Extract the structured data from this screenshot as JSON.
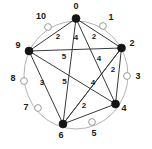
{
  "chart_data": {
    "type": "diagram",
    "title": "",
    "subtitle": "",
    "xlabel": "",
    "ylabel": "",
    "layout": "circular",
    "node_count": 11,
    "ring_color": "#b4b4b4",
    "filled_node_color": "#141414",
    "hollow_node_color": "#ffffff",
    "edge_color": "#3a3a3a",
    "nodes": [
      {
        "id": "node-0",
        "label": "0",
        "state": "filled",
        "cx": 76.0,
        "cy": 18.5,
        "r": 4.0,
        "label_x": 76.0,
        "label_y": 9.0,
        "label_anchor": "middle"
      },
      {
        "id": "node-1",
        "label": "1",
        "state": "hollow",
        "cx": 103.0,
        "cy": 26.0,
        "r": 3.4,
        "label_x": 111.0,
        "label_y": 20.0,
        "label_anchor": "middle"
      },
      {
        "id": "node-2",
        "label": "2",
        "state": "filled",
        "cx": 121.5,
        "cy": 48.0,
        "r": 4.0,
        "label_x": 132.0,
        "label_y": 46.0,
        "label_anchor": "middle"
      },
      {
        "id": "node-3",
        "label": "3",
        "state": "hollow",
        "cx": 127.0,
        "cy": 76.0,
        "r": 3.4,
        "label_x": 138.0,
        "label_y": 79.0,
        "label_anchor": "middle"
      },
      {
        "id": "node-4",
        "label": "4",
        "state": "filled",
        "cx": 115.5,
        "cy": 104.0,
        "r": 4.0,
        "label_x": 124.0,
        "label_y": 111.0,
        "label_anchor": "middle"
      },
      {
        "id": "node-5",
        "label": "5",
        "state": "hollow",
        "cx": 92.0,
        "cy": 122.0,
        "r": 3.4,
        "label_x": 94.0,
        "label_y": 136.0,
        "label_anchor": "middle"
      },
      {
        "id": "node-6",
        "label": "6",
        "state": "filled",
        "cx": 63.0,
        "cy": 124.0,
        "r": 4.0,
        "label_x": 61.0,
        "label_y": 138.0,
        "label_anchor": "middle"
      },
      {
        "id": "node-7",
        "label": "7",
        "state": "hollow",
        "cx": 38.0,
        "cy": 108.0,
        "r": 3.4,
        "label_x": 26.0,
        "label_y": 110.0,
        "label_anchor": "middle"
      },
      {
        "id": "node-8",
        "label": "8",
        "state": "hollow",
        "cx": 24.0,
        "cy": 81.0,
        "r": 3.4,
        "label_x": 13.0,
        "label_y": 81.0,
        "label_anchor": "middle"
      },
      {
        "id": "node-9",
        "label": "9",
        "state": "filled",
        "cx": 29.0,
        "cy": 51.0,
        "r": 4.0,
        "label_x": 18.0,
        "label_y": 48.0,
        "label_anchor": "middle"
      },
      {
        "id": "node-10",
        "label": "10",
        "state": "hollow",
        "cx": 48.0,
        "cy": 27.0,
        "r": 3.4,
        "label_x": 41.0,
        "label_y": 19.0,
        "label_anchor": "middle"
      }
    ],
    "ring": {
      "cx": 76.0,
      "cy": 75.0,
      "rx": 52.0,
      "ry": 54.0
    },
    "edges": [
      {
        "id": "edge-0-9",
        "from": "0",
        "to": "9",
        "weight": "2",
        "x1": 76.0,
        "y1": 18.5,
        "x2": 29.0,
        "y2": 51.0,
        "lx": 58.0,
        "ly": 39.0
      },
      {
        "id": "edge-0-2",
        "from": "0",
        "to": "2",
        "weight": "2",
        "x1": 76.0,
        "y1": 18.5,
        "x2": 121.5,
        "y2": 48.0,
        "lx": 94.0,
        "ly": 39.0
      },
      {
        "id": "edge-0-6",
        "from": "0",
        "to": "6",
        "weight": "4",
        "x1": 76.0,
        "y1": 18.5,
        "x2": 63.0,
        "y2": 124.0,
        "lx": 76.0,
        "ly": 40.0
      },
      {
        "id": "edge-0-4",
        "from": "0",
        "to": "4",
        "weight": "4",
        "x1": 76.0,
        "y1": 18.5,
        "x2": 115.5,
        "y2": 104.0,
        "lx": 99.0,
        "ly": 61.0
      },
      {
        "id": "edge-9-2",
        "from": "9",
        "to": "2",
        "weight": "",
        "x1": 29.0,
        "y1": 51.0,
        "x2": 121.5,
        "y2": 48.0,
        "lx": 0,
        "ly": 0
      },
      {
        "id": "edge-9-4",
        "from": "9",
        "to": "4",
        "weight": "5",
        "x1": 29.0,
        "y1": 51.0,
        "x2": 115.5,
        "y2": 104.0,
        "lx": 64.5,
        "ly": 84.0
      },
      {
        "id": "edge-9-6",
        "from": "9",
        "to": "6",
        "weight": "3",
        "x1": 29.0,
        "y1": 51.0,
        "x2": 63.0,
        "y2": 124.0,
        "lx": 42.0,
        "ly": 85.0
      },
      {
        "id": "edge-2-6",
        "from": "2",
        "to": "6",
        "weight": "5",
        "x1": 121.5,
        "y1": 48.0,
        "x2": 63.0,
        "y2": 124.0,
        "lx": 64.0,
        "ly": 59.0
      },
      {
        "id": "edge-2-4",
        "from": "2",
        "to": "4",
        "weight": "2",
        "x1": 121.5,
        "y1": 48.0,
        "x2": 115.5,
        "y2": 104.0,
        "lx": 113.0,
        "ly": 72.0
      },
      {
        "id": "edge-6-4",
        "from": "6",
        "to": "4",
        "weight": "2",
        "x1": 63.0,
        "y1": 124.0,
        "x2": 115.5,
        "y2": 104.0,
        "lx": 84.0,
        "ly": 108.0
      },
      {
        "id": "edge-6-2b",
        "from": "6",
        "to": "2",
        "weight": "4",
        "x1": 63.0,
        "y1": 124.0,
        "x2": 121.5,
        "y2": 48.0,
        "lx": 93.0,
        "ly": 85.0
      }
    ]
  }
}
